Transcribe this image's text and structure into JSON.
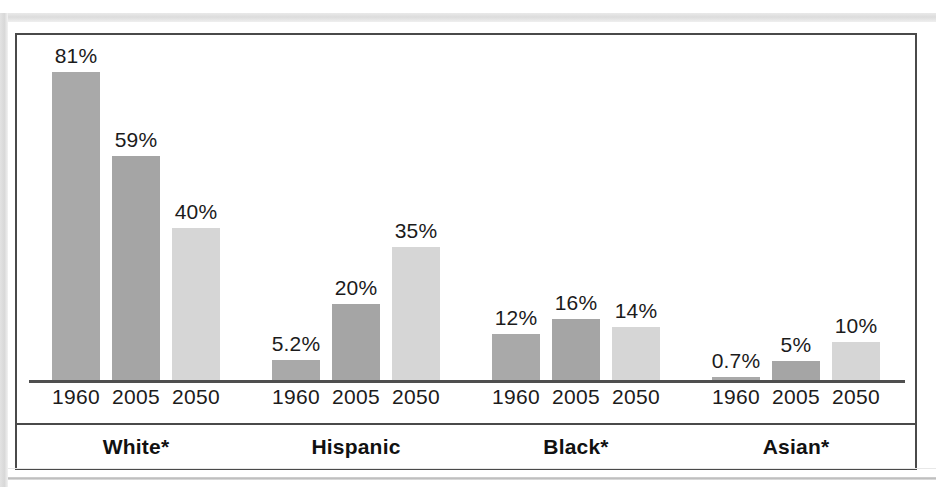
{
  "chart_data": {
    "type": "bar",
    "title": "",
    "subtitle": "",
    "xlabel": "",
    "ylabel": "",
    "grid": false,
    "legend": "none",
    "ylim": [
      0,
      85
    ],
    "categories": [
      "White*",
      "Hispanic",
      "Black*",
      "Asian*"
    ],
    "x": [
      "1960",
      "2005",
      "2050"
    ],
    "series": [
      {
        "name": "1960",
        "values": [
          81,
          5.2,
          12,
          0.7
        ],
        "labels": [
          "81%",
          "5.2%",
          "12%",
          "0.7%"
        ],
        "color": "#a9a9a9"
      },
      {
        "name": "2005",
        "values": [
          59,
          20,
          16,
          5
        ],
        "labels": [
          "59%",
          "20%",
          "16%",
          "5%"
        ],
        "color": "#a5a5a5"
      },
      {
        "name": "2050",
        "values": [
          40,
          35,
          14,
          10
        ],
        "labels": [
          "40%",
          "35%",
          "14%",
          "10%"
        ],
        "color": "#d6d6d6"
      }
    ],
    "groups": [
      {
        "label": "White*",
        "bars": [
          {
            "year": "1960",
            "value": 81,
            "value_label": "81%",
            "color": "#a9a9a9"
          },
          {
            "year": "2005",
            "value": 59,
            "value_label": "59%",
            "color": "#a5a5a5"
          },
          {
            "year": "2050",
            "value": 40,
            "value_label": "40%",
            "color": "#d6d6d6"
          }
        ]
      },
      {
        "label": "Hispanic",
        "bars": [
          {
            "year": "1960",
            "value": 5.2,
            "value_label": "5.2%",
            "color": "#a9a9a9"
          },
          {
            "year": "2005",
            "value": 20,
            "value_label": "20%",
            "color": "#a5a5a5"
          },
          {
            "year": "2050",
            "value": 35,
            "value_label": "35%",
            "color": "#d6d6d6"
          }
        ]
      },
      {
        "label": "Black*",
        "bars": [
          {
            "year": "1960",
            "value": 12,
            "value_label": "12%",
            "color": "#a9a9a9"
          },
          {
            "year": "2005",
            "value": 16,
            "value_label": "16%",
            "color": "#a5a5a5"
          },
          {
            "year": "2050",
            "value": 14,
            "value_label": "14%",
            "color": "#d6d6d6"
          }
        ]
      },
      {
        "label": "Asian*",
        "bars": [
          {
            "year": "1960",
            "value": 0.7,
            "value_label": "0.7%",
            "color": "#a9a9a9"
          },
          {
            "year": "2005",
            "value": 5,
            "value_label": "5%",
            "color": "#a5a5a5"
          },
          {
            "year": "2050",
            "value": 10,
            "value_label": "10%",
            "color": "#d6d6d6"
          }
        ]
      }
    ]
  },
  "style": {
    "frame_border": "#4a4a4a",
    "axis_color": "#4f4f4f",
    "text_color": "#1b1b1b",
    "background": "#ffffff"
  }
}
